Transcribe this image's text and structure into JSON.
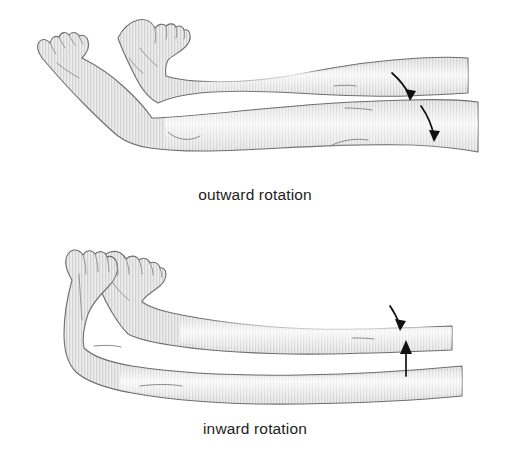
{
  "page": {
    "background_color": "#ffffff",
    "width": 510,
    "height": 453
  },
  "style": {
    "outline_color": "#6e6e6e",
    "crease_color": "#8a8a8a",
    "skin_fill": "#e3e3e3",
    "skin_fill_light": "#f2f2f2",
    "stripe_color": "#cfcfcf",
    "arrow_color": "#111111",
    "caption_color": "#1d1d1d"
  },
  "panels": [
    {
      "id": "outward",
      "caption": "outward rotation",
      "description": "Two legs lying down viewed from the feet, feet splayed outward away from each other",
      "arrows": [
        {
          "name": "upper-arrow",
          "direction": "down-curved",
          "meaning": "rotate outward"
        },
        {
          "name": "lower-arrow",
          "direction": "down-curved",
          "meaning": "rotate outward"
        }
      ]
    },
    {
      "id": "inward",
      "caption": "inward rotation",
      "description": "Two legs lying down viewed from the feet, feet rolled inward toward each other",
      "arrows": [
        {
          "name": "upper-arrow",
          "direction": "down-curved",
          "meaning": "rotate inward"
        },
        {
          "name": "lower-arrow",
          "direction": "up-straight",
          "meaning": "rotate inward"
        }
      ]
    }
  ]
}
